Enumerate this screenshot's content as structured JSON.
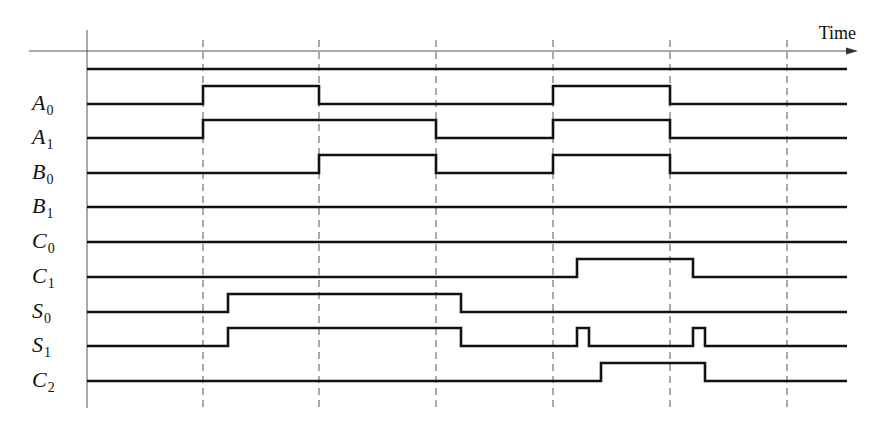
{
  "axis": {
    "label": "Time",
    "y": 51,
    "x_start": 29,
    "x_end": 858
  },
  "grid": {
    "solid_x": 87,
    "dashed_x": [
      203,
      319,
      436,
      553,
      670,
      787
    ],
    "top_solid": 30,
    "top_dashed": 40,
    "bottom": 408
  },
  "plot": {
    "x_start": 87,
    "x_end": 847,
    "high_offset": 18
  },
  "colors": {
    "line": "#111111",
    "grid": "#555555"
  },
  "signals": [
    {
      "name": "",
      "sub": "",
      "y": 69,
      "transitions": [],
      "initial": 0
    },
    {
      "name": "A",
      "sub": "0",
      "y": 104,
      "initial": 0,
      "transitions": [
        203,
        319,
        553,
        670
      ]
    },
    {
      "name": "A",
      "sub": "1",
      "y": 138,
      "initial": 0,
      "transitions": [
        203,
        436,
        553,
        670
      ]
    },
    {
      "name": "B",
      "sub": "0",
      "y": 173,
      "initial": 0,
      "transitions": [
        319,
        436,
        553,
        670
      ]
    },
    {
      "name": "B",
      "sub": "1",
      "y": 207,
      "initial": 0,
      "transitions": []
    },
    {
      "name": "C",
      "sub": "0",
      "y": 242,
      "initial": 0,
      "transitions": []
    },
    {
      "name": "C",
      "sub": "1",
      "y": 277,
      "initial": 0,
      "transitions": [
        577,
        693
      ]
    },
    {
      "name": "S",
      "sub": "0",
      "y": 312,
      "initial": 0,
      "transitions": [
        228,
        461
      ]
    },
    {
      "name": "S",
      "sub": "1",
      "y": 346,
      "initial": 0,
      "transitions": [
        228,
        461,
        577,
        589,
        693,
        705
      ]
    },
    {
      "name": "C",
      "sub": "2",
      "y": 381,
      "initial": 0,
      "transitions": [
        601,
        705
      ]
    }
  ]
}
